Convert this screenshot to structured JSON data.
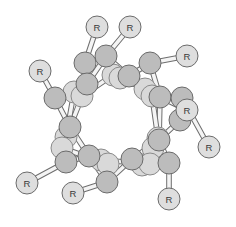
{
  "diagram": {
    "type": "ball-and-stick molecular ring",
    "substituent_label": "R",
    "colors": {
      "background": "#ffffff",
      "front_atom": "#bcbcbc",
      "back_atom": "#d9d9d9",
      "r_group": "#dedede",
      "outline": "#6b6b6b",
      "bond_fill": "#f4f4f4"
    },
    "r_groups": [
      {
        "id": "r1",
        "label": "R",
        "x": 40,
        "y": 71,
        "attached_to": "f1"
      },
      {
        "id": "r2",
        "label": "R",
        "x": 97,
        "y": 27,
        "attached_to": "f2"
      },
      {
        "id": "r3",
        "label": "R",
        "x": 130,
        "y": 27,
        "attached_to": "f3"
      },
      {
        "id": "r4",
        "label": "R",
        "x": 187,
        "y": 56,
        "attached_to": "f5"
      },
      {
        "id": "r5",
        "label": "R",
        "x": 187,
        "y": 110,
        "attached_to": "f7"
      },
      {
        "id": "r6",
        "label": "R",
        "x": 209,
        "y": 147,
        "attached_to": "f8"
      },
      {
        "id": "r7",
        "label": "R",
        "x": 169,
        "y": 199,
        "attached_to": "f10"
      },
      {
        "id": "r8",
        "label": "R",
        "x": 73,
        "y": 193,
        "attached_to": "f14"
      },
      {
        "id": "r9",
        "label": "R",
        "x": 27,
        "y": 183,
        "attached_to": "f13"
      }
    ],
    "back_atoms": [
      {
        "id": "b1",
        "x": 74,
        "y": 92
      },
      {
        "id": "b2",
        "x": 82,
        "y": 96
      },
      {
        "id": "b3",
        "x": 113,
        "y": 75
      },
      {
        "id": "b4",
        "x": 120,
        "y": 78
      },
      {
        "id": "b5",
        "x": 145,
        "y": 89
      },
      {
        "id": "b6",
        "x": 152,
        "y": 96
      },
      {
        "id": "b7",
        "x": 158,
        "y": 138
      },
      {
        "id": "b8",
        "x": 153,
        "y": 148
      },
      {
        "id": "b9",
        "x": 142,
        "y": 165
      },
      {
        "id": "b10",
        "x": 150,
        "y": 164
      },
      {
        "id": "b11",
        "x": 101,
        "y": 160
      },
      {
        "id": "b12",
        "x": 108,
        "y": 164
      },
      {
        "id": "b13",
        "x": 66,
        "y": 137
      },
      {
        "id": "b14",
        "x": 62,
        "y": 148
      }
    ],
    "front_atoms": [
      {
        "id": "f1",
        "x": 55,
        "y": 98
      },
      {
        "id": "f2",
        "x": 85,
        "y": 63
      },
      {
        "id": "f3",
        "x": 106,
        "y": 56
      },
      {
        "id": "f4",
        "x": 87,
        "y": 84
      },
      {
        "id": "f5",
        "x": 150,
        "y": 63
      },
      {
        "id": "f6",
        "x": 129,
        "y": 76
      },
      {
        "id": "f7",
        "x": 160,
        "y": 97
      },
      {
        "id": "f8",
        "x": 182,
        "y": 98
      },
      {
        "id": "f9",
        "x": 180,
        "y": 120
      },
      {
        "id": "f10",
        "x": 169,
        "y": 163
      },
      {
        "id": "f11",
        "x": 159,
        "y": 140
      },
      {
        "id": "f12",
        "x": 132,
        "y": 159
      },
      {
        "id": "f13",
        "x": 66,
        "y": 162
      },
      {
        "id": "f14",
        "x": 107,
        "y": 182
      },
      {
        "id": "f15",
        "x": 89,
        "y": 156
      },
      {
        "id": "f16",
        "x": 70,
        "y": 127
      }
    ],
    "bonds": [
      [
        "r1",
        "f1"
      ],
      [
        "r2",
        "f2"
      ],
      [
        "r3",
        "f3"
      ],
      [
        "r4",
        "f5"
      ],
      [
        "r5",
        "f7"
      ],
      [
        "r6",
        "f8"
      ],
      [
        "r7",
        "f10"
      ],
      [
        "r8",
        "f14"
      ],
      [
        "r9",
        "f13"
      ],
      [
        "f1",
        "f4"
      ],
      [
        "f1",
        "f16"
      ],
      [
        "f2",
        "f4"
      ],
      [
        "f3",
        "f4"
      ],
      [
        "f3",
        "f6"
      ],
      [
        "f6",
        "f5"
      ],
      [
        "f5",
        "f7"
      ],
      [
        "f7",
        "f8"
      ],
      [
        "f8",
        "f9"
      ],
      [
        "f9",
        "f11"
      ],
      [
        "f7",
        "f11"
      ],
      [
        "f11",
        "f10"
      ],
      [
        "f10",
        "f12"
      ],
      [
        "f12",
        "f14"
      ],
      [
        "f14",
        "f15"
      ],
      [
        "f15",
        "f13"
      ],
      [
        "f13",
        "f16"
      ],
      [
        "f16",
        "f4"
      ],
      [
        "f12",
        "f11"
      ],
      [
        "f15",
        "f16"
      ],
      [
        "b1",
        "b2"
      ],
      [
        "b3",
        "b4"
      ],
      [
        "b5",
        "b6"
      ],
      [
        "b7",
        "b8"
      ],
      [
        "b9",
        "b10"
      ],
      [
        "b11",
        "b12"
      ],
      [
        "b13",
        "b14"
      ],
      [
        "b2",
        "b3"
      ],
      [
        "b4",
        "b5"
      ],
      [
        "b6",
        "b7"
      ],
      [
        "b8",
        "b9"
      ],
      [
        "b10",
        "b11"
      ],
      [
        "b12",
        "b14"
      ],
      [
        "b13",
        "b1"
      ]
    ]
  }
}
